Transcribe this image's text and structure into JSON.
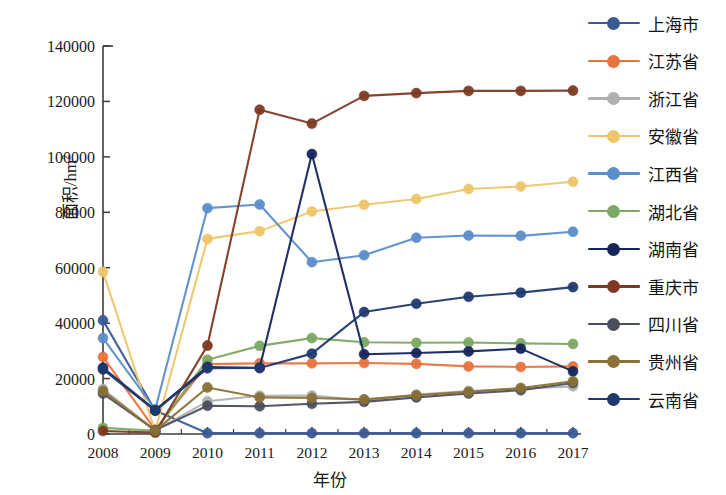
{
  "chart_data": {
    "type": "line",
    "title": "",
    "xlabel": "年份",
    "ylabel": "面积/hm2",
    "ylabel_base": "面积/hm",
    "ylabel_sup": "2",
    "x": [
      "2008",
      "2009",
      "2010",
      "2011",
      "2012",
      "2013",
      "2014",
      "2015",
      "2016",
      "2017"
    ],
    "categories": [
      "2008",
      "2009",
      "2010",
      "2011",
      "2012",
      "2013",
      "2014",
      "2015",
      "2016",
      "2017"
    ],
    "yticks": [
      0,
      20000,
      40000,
      60000,
      80000,
      100000,
      120000,
      140000
    ],
    "ytick_labels": [
      "0",
      "20000",
      "40000",
      "60000",
      "80000",
      "100000",
      "120000",
      "140000"
    ],
    "ylim": [
      0,
      140000
    ],
    "grid": false,
    "legend_position": "right",
    "series": [
      {
        "name": "上海市",
        "color": "#3a5a96",
        "values": [
          41000,
          8500,
          300,
          300,
          300,
          300,
          300,
          300,
          300,
          300
        ]
      },
      {
        "name": "江苏省",
        "color": "#e8733f",
        "values": [
          27800,
          1500,
          25200,
          25500,
          25500,
          25600,
          25300,
          24400,
          24200,
          24400
        ]
      },
      {
        "name": "浙江省",
        "color": "#b0b0b0",
        "values": [
          16200,
          1300,
          11800,
          13800,
          13900,
          12200,
          14200,
          15500,
          16300,
          17200
        ]
      },
      {
        "name": "安徽省",
        "color": "#eec66a",
        "values": [
          58500,
          1000,
          70400,
          73200,
          80300,
          82700,
          84800,
          88400,
          89300,
          91000
        ]
      },
      {
        "name": "江西省",
        "color": "#5b8ecb",
        "values": [
          34600,
          8800,
          81500,
          82800,
          62000,
          64500,
          70800,
          71600,
          71500,
          73000
        ]
      },
      {
        "name": "湖北省",
        "color": "#7ba862",
        "values": [
          2200,
          1200,
          26800,
          31800,
          34600,
          33100,
          32900,
          33000,
          32700,
          32500
        ]
      },
      {
        "name": "湖南省",
        "color": "#15255c",
        "values": [
          23900,
          8600,
          24200,
          23900,
          101000,
          28800,
          29200,
          29800,
          30800,
          22600
        ]
      },
      {
        "name": "重庆市",
        "color": "#7d3a22",
        "values": [
          1100,
          500,
          31900,
          117000,
          112000,
          122000,
          123000,
          123800,
          123800,
          123900
        ]
      },
      {
        "name": "四川省",
        "color": "#4a4f5e",
        "values": [
          14600,
          1400,
          10200,
          10000,
          10900,
          11600,
          13200,
          14600,
          15800,
          18400
        ]
      },
      {
        "name": "贵州省",
        "color": "#8a7135",
        "values": [
          15500,
          1200,
          16800,
          13200,
          13000,
          12500,
          14000,
          15200,
          16600,
          19000
        ]
      },
      {
        "name": "云南省",
        "color": "#1e3a6e",
        "values": [
          23300,
          8400,
          23700,
          23800,
          29000,
          44000,
          47000,
          49500,
          51000,
          53000
        ]
      }
    ]
  },
  "legend": {
    "items": [
      {
        "label": "上海市",
        "color": "#3a5a96"
      },
      {
        "label": "江苏省",
        "color": "#e8733f"
      },
      {
        "label": "浙江省",
        "color": "#b0b0b0"
      },
      {
        "label": "安徽省",
        "color": "#eec66a"
      },
      {
        "label": "江西省",
        "color": "#5b8ecb"
      },
      {
        "label": "湖北省",
        "color": "#7ba862"
      },
      {
        "label": "湖南省",
        "color": "#15255c"
      },
      {
        "label": "重庆市",
        "color": "#7d3a22"
      },
      {
        "label": "四川省",
        "color": "#4a4f5e"
      },
      {
        "label": "贵州省",
        "color": "#8a7135"
      },
      {
        "label": "云南省",
        "color": "#1e3a6e"
      }
    ]
  }
}
